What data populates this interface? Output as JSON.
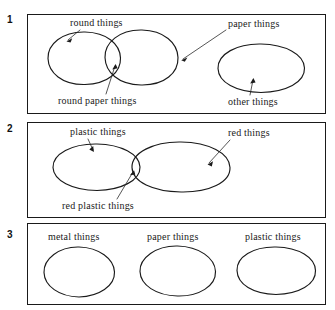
{
  "figure": {
    "panels": [
      {
        "number": "1",
        "labels": [
          {
            "text": "round things",
            "name": "label-round-things"
          },
          {
            "text": "paper things",
            "name": "label-paper-things"
          },
          {
            "text": "round paper things",
            "name": "label-round-paper-things"
          },
          {
            "text": "other things",
            "name": "label-other-things"
          }
        ],
        "sets": [
          {
            "name": "round-things-set",
            "relation": "overlaps-paper-things"
          },
          {
            "name": "paper-things-set",
            "relation": "overlaps-round-things"
          },
          {
            "name": "other-things-set",
            "relation": "disjoint"
          }
        ]
      },
      {
        "number": "2",
        "labels": [
          {
            "text": "plastic things",
            "name": "label-plastic-things"
          },
          {
            "text": "red things",
            "name": "label-red-things"
          },
          {
            "text": "red plastic things",
            "name": "label-red-plastic-things"
          }
        ],
        "sets": [
          {
            "name": "plastic-things-set",
            "relation": "overlaps-red-things"
          },
          {
            "name": "red-things-set",
            "relation": "overlaps-plastic-things"
          }
        ]
      },
      {
        "number": "3",
        "labels": [
          {
            "text": "metal things",
            "name": "label-metal-things"
          },
          {
            "text": "paper things",
            "name": "label-paper-things"
          },
          {
            "text": "plastic things",
            "name": "label-plastic-things"
          }
        ],
        "sets": [
          {
            "name": "metal-things-set",
            "relation": "disjoint"
          },
          {
            "name": "paper-things-set",
            "relation": "disjoint"
          },
          {
            "name": "plastic-things-set",
            "relation": "disjoint"
          }
        ]
      }
    ],
    "colors": {
      "ink": "#1a1a1a",
      "leader": "#2b2b2b",
      "background": "#ffffff"
    }
  }
}
